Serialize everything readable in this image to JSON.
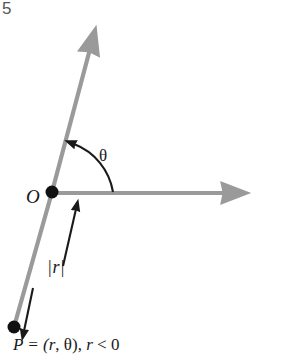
{
  "figure": {
    "number_text": "5",
    "background_color": "#ffffff",
    "ray_color": "#9a9a9a",
    "ink_color": "#1a1a1a",
    "width": 288,
    "height": 363
  },
  "labels": {
    "origin": "O",
    "angle": "θ",
    "radius_open": "|",
    "radius_var": "r",
    "radius_close": "|",
    "point_lead": "P = (",
    "point_r": "r",
    "point_sep": ", ",
    "point_theta": "θ",
    "point_tail": "), ",
    "point_r2": "r",
    "point_cond": " < 0"
  },
  "geometry": {
    "origin": {
      "x": 52,
      "y": 192,
      "dot_radius": 6.5
    },
    "point_p": {
      "x": 14,
      "y": 327,
      "dot_radius": 6.5
    },
    "polar_axis_end": {
      "x": 232,
      "y": 193
    },
    "terminal_ray_end": {
      "x": 87,
      "y": 40
    },
    "negative_ray_end": {
      "x": 14,
      "y": 327
    },
    "angle_arc": {
      "start": {
        "x": 113,
        "y": 193
      },
      "end": {
        "x": 71,
        "y": 141
      },
      "radius": 62
    },
    "annotation_arrow_up": {
      "from": {
        "x": 63,
        "y": 265
      },
      "to": {
        "x": 75,
        "y": 205
      }
    },
    "annotation_arrow_down": {
      "from": {
        "x": 33,
        "y": 289
      },
      "to": {
        "x": 23,
        "y": 336
      }
    }
  }
}
